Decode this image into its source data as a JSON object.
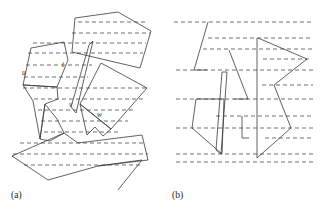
{
  "figure": {
    "background_color": "#ffffff",
    "line_color": "#3a3a3a",
    "dash_color": "#555555",
    "panels": [
      {
        "id": "a",
        "caption": "(a)",
        "caption_x": 11,
        "caption_y": 198
      },
      {
        "id": "b",
        "caption": "(b)",
        "caption_x": 172,
        "caption_y": 198
      }
    ]
  },
  "panel_a": {
    "caption": "(a)",
    "labels": [
      {
        "text": "u",
        "x": 22,
        "y": 75
      },
      {
        "text": "t",
        "x": 62,
        "y": 67
      },
      {
        "text": "v",
        "x": 69,
        "y": 107
      },
      {
        "text": "w",
        "x": 97,
        "y": 117
      }
    ],
    "polygons": [
      {
        "name": "top-right-pentagon",
        "points": "75,18 118,12 151,31 140,68 72,52"
      },
      {
        "name": "left-quadrilateral",
        "points": "31,48 64,42 68,60 57,87 23,85"
      },
      {
        "name": "left-spike-polygon",
        "points": "23,85 57,87 58,99 45,104 40,139 33,101"
      },
      {
        "name": "middle-zigzag",
        "points": "40,139 45,104 57,119 64,133 50,141"
      },
      {
        "name": "upper-middle-sliver",
        "points": "89,45 93,41 76,113 71,107"
      },
      {
        "name": "right-quadrilateral",
        "points": "101,63 147,88 111,129 80,104"
      },
      {
        "name": "lower-right-notch",
        "points": "80,104 111,129 103,136 95,127 87,135"
      },
      {
        "name": "bottom-arrow",
        "points": "12,156 64,133 78,143 142,135 148,160 98,166 48,180"
      },
      {
        "name": "bottom-right-triangle",
        "points": "98,166 142,160 118,190"
      }
    ],
    "sweep_lines": [
      {
        "y": 22,
        "x1": 78,
        "x2": 148
      },
      {
        "y": 33,
        "x1": 72,
        "x2": 150
      },
      {
        "y": 43,
        "x1": 33,
        "x2": 146
      },
      {
        "y": 53,
        "x1": 28,
        "x2": 143
      },
      {
        "y": 65,
        "x1": 26,
        "x2": 92
      },
      {
        "y": 77,
        "x1": 24,
        "x2": 88
      },
      {
        "y": 88,
        "x1": 23,
        "x2": 146
      },
      {
        "y": 99,
        "x1": 34,
        "x2": 143
      },
      {
        "y": 110,
        "x1": 38,
        "x2": 136
      },
      {
        "y": 121,
        "x1": 41,
        "x2": 128
      },
      {
        "y": 132,
        "x1": 44,
        "x2": 120
      },
      {
        "y": 143,
        "x1": 20,
        "x2": 145
      },
      {
        "y": 154,
        "x1": 13,
        "x2": 148
      },
      {
        "y": 165,
        "x1": 24,
        "x2": 140
      }
    ]
  },
  "panel_b": {
    "caption": "(b)",
    "polygons": [
      {
        "name": "left-upper-wedge",
        "points": "208,22 194,70 207,70"
      },
      {
        "name": "left-lower-quad",
        "points": "196,99 224,99 222,154 192,128"
      },
      {
        "name": "center-left-strip",
        "points": "222,72 227,72 221,154 216,150"
      },
      {
        "name": "center-triangle",
        "points": "229,50 248,99 234,99"
      },
      {
        "name": "inner-bracket",
        "points": "242,116 242,138 249,138"
      },
      {
        "name": "center-vertical-bar",
        "points": "257,38 257,158"
      },
      {
        "name": "right-upper-triangle",
        "points": "258,38 307,59 274,85"
      },
      {
        "name": "right-lower-quad",
        "points": "274,85 291,128 257,158"
      }
    ],
    "sweep_lines": [
      {
        "y": 22,
        "x1": 174,
        "x2": 313
      },
      {
        "y": 38,
        "x1": 208,
        "x2": 313
      },
      {
        "y": 49,
        "x1": 203,
        "x2": 313
      },
      {
        "y": 59,
        "x1": 263,
        "x2": 310
      },
      {
        "y": 70,
        "x1": 176,
        "x2": 313
      },
      {
        "y": 85,
        "x1": 262,
        "x2": 313
      },
      {
        "y": 99,
        "x1": 176,
        "x2": 313
      },
      {
        "y": 116,
        "x1": 216,
        "x2": 313
      },
      {
        "y": 128,
        "x1": 176,
        "x2": 313
      },
      {
        "y": 138,
        "x1": 265,
        "x2": 313
      },
      {
        "y": 154,
        "x1": 176,
        "x2": 313
      },
      {
        "y": 162,
        "x1": 176,
        "x2": 313
      }
    ]
  }
}
